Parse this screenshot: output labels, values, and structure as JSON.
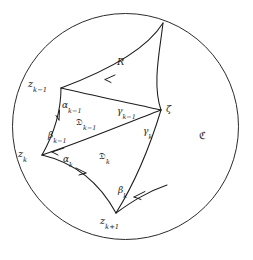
{
  "figure": {
    "stroke_color": "#1c1c1c",
    "background_color": "#ffffff",
    "circle": {
      "label": "C",
      "cx": 125.5,
      "cy": 126.5,
      "r": 113
    }
  },
  "labels": {
    "region_exterior": "ℭ",
    "region_R": "R",
    "region_D_k_minus_1": "𝔇",
    "region_D_k": "𝔇",
    "vertex_z_k_minus_1": "z",
    "vertex_z_k": "z",
    "vertex_z_k_plus_1": "z",
    "vertex_zeta": "ζ",
    "edge_alpha_k_minus_1": "α",
    "edge_alpha_k": "α",
    "edge_beta_k_minus_1": "β",
    "edge_beta_k": "β",
    "edge_gamma_k_minus_1": "γ",
    "edge_gamma_k": "γ"
  },
  "subscripts": {
    "k_minus_1": "k−1",
    "k": "k",
    "k_plus_1": "k+1"
  },
  "vertices": [
    {
      "name": "z_k_minus_1",
      "x": 61,
      "y": 88,
      "text": "z",
      "sub": "k−1"
    },
    {
      "name": "zeta",
      "x": 161,
      "y": 110,
      "text": "ζ",
      "sub": ""
    },
    {
      "name": "z_k",
      "x": 42,
      "y": 155,
      "text": "z",
      "sub": "k"
    },
    {
      "name": "z_k_plus_1",
      "x": 116,
      "y": 213,
      "text": "z",
      "sub": "k+1"
    },
    {
      "name": "boundary_top",
      "x": 163,
      "y": 23,
      "text": "",
      "sub": ""
    }
  ],
  "edges": [
    {
      "name": "alpha_k_minus_1",
      "symbol": "α",
      "sub": "k−1",
      "from": "z_k_minus_1",
      "to": "zeta"
    },
    {
      "name": "gamma_k_minus_1",
      "symbol": "γ",
      "sub": "k−1",
      "from": "z_k_minus_1",
      "to": "zeta"
    },
    {
      "name": "beta_k_minus_1",
      "symbol": "β",
      "sub": "k−1",
      "from": "z_k_minus_1",
      "to": "z_k"
    },
    {
      "name": "alpha_k",
      "symbol": "α",
      "sub": "k",
      "from": "z_k",
      "to": "zeta"
    },
    {
      "name": "gamma_k",
      "symbol": "γ",
      "sub": "k",
      "from": "zeta",
      "to": "z_k_plus_1"
    },
    {
      "name": "beta_k",
      "symbol": "β",
      "sub": "k",
      "from": "z_k",
      "to": "z_k_plus_1"
    }
  ],
  "regions": [
    {
      "name": "R",
      "symbol": "R",
      "sub": "",
      "x": 120,
      "y": 63
    },
    {
      "name": "D_k_minus_1",
      "symbol": "𝔇",
      "sub": "k−1",
      "x": 86,
      "y": 123
    },
    {
      "name": "D_k",
      "symbol": "𝔇",
      "sub": "k",
      "x": 106,
      "y": 157
    },
    {
      "name": "C_exterior",
      "symbol": "ℭ",
      "sub": "",
      "x": 204,
      "y": 137
    }
  ]
}
